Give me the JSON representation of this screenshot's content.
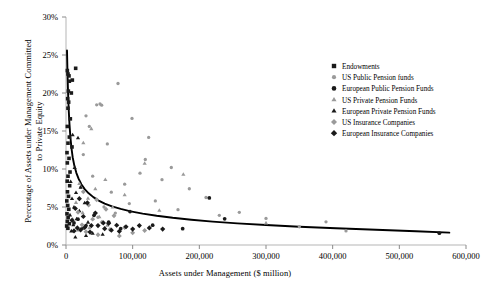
{
  "chart_data": {
    "type": "scatter",
    "title": "",
    "xlabel": "Assets under Management ($ million)",
    "ylabel": "Percentage of Assets under Management Committed to Private Equity",
    "xlim": [
      0,
      600000
    ],
    "ylim": [
      0,
      0.3
    ],
    "xticks": [
      0,
      100000,
      200000,
      300000,
      400000,
      500000,
      600000
    ],
    "xticklabels": [
      "0",
      "100,000",
      "200,000",
      "300,000",
      "400,000",
      "500,000",
      "600,000"
    ],
    "yticks": [
      0,
      0.05,
      0.1,
      0.15,
      0.2,
      0.25,
      0.3
    ],
    "yticklabels": [
      "0%",
      "5%",
      "10%",
      "15%",
      "20%",
      "25%",
      "30%"
    ],
    "grid": false,
    "legend_position": "right-top",
    "series": [
      {
        "name": "Endowments",
        "marker": "square",
        "color": "#1a1a1a",
        "size": 3.6,
        "points": [
          [
            2000,
            0.2295
          ],
          [
            3000,
            0.225
          ],
          [
            4500,
            0.2225
          ],
          [
            14500,
            0.2325
          ],
          [
            5000,
            0.2155
          ],
          [
            9500,
            0.217
          ],
          [
            3500,
            0.2025
          ],
          [
            8000,
            0.2
          ],
          [
            2500,
            0.1925
          ],
          [
            4000,
            0.188
          ],
          [
            3000,
            0.18
          ],
          [
            6500,
            0.166
          ],
          [
            2000,
            0.156
          ],
          [
            5000,
            0.142
          ],
          [
            3000,
            0.134
          ],
          [
            9000,
            0.129
          ],
          [
            1500,
            0.1215
          ],
          [
            4500,
            0.114
          ],
          [
            2000,
            0.108
          ],
          [
            6000,
            0.096
          ],
          [
            3000,
            0.0905
          ],
          [
            1800,
            0.084
          ],
          [
            5500,
            0.078
          ],
          [
            2200,
            0.07
          ],
          [
            3800,
            0.064
          ],
          [
            1200,
            0.058
          ],
          [
            2600,
            0.052
          ],
          [
            4200,
            0.047
          ],
          [
            1500,
            0.041
          ],
          [
            3200,
            0.036
          ],
          [
            2000,
            0.031
          ],
          [
            5000,
            0.028
          ],
          [
            1000,
            0.025
          ],
          [
            2800,
            0.022
          ]
        ]
      },
      {
        "name": "US Public Pension funds",
        "marker": "circle",
        "color": "#9a9a9a",
        "size": 3.0,
        "points": [
          [
            78000,
            0.2125
          ],
          [
            46000,
            0.1845
          ],
          [
            51000,
            0.1855
          ],
          [
            53500,
            0.184
          ],
          [
            99000,
            0.1665
          ],
          [
            124000,
            0.1415
          ],
          [
            30000,
            0.17
          ],
          [
            35000,
            0.156
          ],
          [
            62000,
            0.133
          ],
          [
            119000,
            0.1125
          ],
          [
            158000,
            0.102
          ],
          [
            111000,
            0.0945
          ],
          [
            144000,
            0.086
          ],
          [
            26000,
            0.119
          ],
          [
            88000,
            0.08
          ],
          [
            185000,
            0.074
          ],
          [
            40000,
            0.0905
          ],
          [
            68000,
            0.0695
          ],
          [
            210000,
            0.0625
          ],
          [
            134000,
            0.058
          ],
          [
            95000,
            0.0545
          ],
          [
            57000,
            0.05
          ],
          [
            168000,
            0.0465
          ],
          [
            260000,
            0.043
          ],
          [
            230000,
            0.039
          ],
          [
            300000,
            0.035
          ],
          [
            390000,
            0.0305
          ],
          [
            350000,
            0.024
          ],
          [
            420000,
            0.0185
          ],
          [
            22000,
            0.076
          ],
          [
            74000,
            0.042
          ],
          [
            48000,
            0.0365
          ]
        ]
      },
      {
        "name": "European Public Pension Funds",
        "marker": "circle",
        "color": "#1a1a1a",
        "size": 3.4,
        "points": [
          [
            215000,
            0.062
          ],
          [
            238000,
            0.0345
          ],
          [
            560000,
            0.0155
          ],
          [
            96000,
            0.044
          ],
          [
            42000,
            0.039
          ],
          [
            64000,
            0.03
          ],
          [
            18000,
            0.034
          ],
          [
            130000,
            0.026
          ],
          [
            175000,
            0.0215
          ],
          [
            30000,
            0.0255
          ],
          [
            82000,
            0.0215
          ],
          [
            12000,
            0.029
          ]
        ]
      },
      {
        "name": "US Private Pension Funds",
        "marker": "triangle",
        "color": "#9a9a9a",
        "size": 3.6,
        "points": [
          [
            38000,
            0.153
          ],
          [
            26000,
            0.1345
          ],
          [
            118000,
            0.1075
          ],
          [
            176000,
            0.093
          ],
          [
            59000,
            0.086
          ],
          [
            20000,
            0.081
          ],
          [
            44000,
            0.074
          ],
          [
            88000,
            0.066
          ],
          [
            33000,
            0.0615
          ],
          [
            15000,
            0.056
          ],
          [
            70000,
            0.05
          ],
          [
            140000,
            0.0455
          ],
          [
            25000,
            0.0425
          ],
          [
            50000,
            0.037
          ],
          [
            10000,
            0.034
          ],
          [
            300000,
            0.029
          ],
          [
            62000,
            0.026
          ],
          [
            35000,
            0.0225
          ],
          [
            18000,
            0.0195
          ]
        ]
      },
      {
        "name": "European Private Pension Funds",
        "marker": "triangle",
        "color": "#1a1a1a",
        "size": 3.6,
        "points": [
          [
            10000,
            0.145
          ],
          [
            18000,
            0.141
          ],
          [
            13000,
            0.102
          ],
          [
            7000,
            0.0835
          ],
          [
            22000,
            0.076
          ],
          [
            15000,
            0.069
          ],
          [
            9000,
            0.061
          ],
          [
            28000,
            0.0555
          ],
          [
            12000,
            0.05
          ],
          [
            20000,
            0.045
          ],
          [
            6000,
            0.0395
          ],
          [
            16000,
            0.0345
          ],
          [
            33000,
            0.03
          ],
          [
            11000,
            0.0265
          ],
          [
            24000,
            0.022
          ],
          [
            8000,
            0.0185
          ],
          [
            40000,
            0.0155
          ],
          [
            30000,
            0.0125
          ],
          [
            14000,
            0.0105
          ],
          [
            55000,
            0.014
          ]
        ]
      },
      {
        "name": "US Insurance Companies",
        "marker": "diamond",
        "color": "#9a9a9a",
        "size": 3.4,
        "points": [
          [
            26000,
            0.07
          ],
          [
            46000,
            0.0595
          ],
          [
            34000,
            0.0525
          ],
          [
            60000,
            0.047
          ],
          [
            18000,
            0.043
          ],
          [
            72000,
            0.0385
          ],
          [
            40000,
            0.034
          ],
          [
            54000,
            0.03
          ],
          [
            24000,
            0.0265
          ],
          [
            88000,
            0.023
          ],
          [
            66000,
            0.0205
          ],
          [
            30000,
            0.0175
          ],
          [
            100000,
            0.016
          ],
          [
            48000,
            0.0135
          ],
          [
            118000,
            0.019
          ],
          [
            80000,
            0.012
          ]
        ]
      },
      {
        "name": "European Insurance Companies",
        "marker": "diamond",
        "color": "#1a1a1a",
        "size": 3.6,
        "points": [
          [
            20000,
            0.061
          ],
          [
            32000,
            0.0555
          ],
          [
            14000,
            0.048
          ],
          [
            44000,
            0.042
          ],
          [
            26000,
            0.0375
          ],
          [
            9000,
            0.0325
          ],
          [
            56000,
            0.029
          ],
          [
            38000,
            0.0255
          ],
          [
            17000,
            0.0225
          ],
          [
            64000,
            0.0285
          ],
          [
            48000,
            0.0255
          ],
          [
            28000,
            0.023
          ],
          [
            76000,
            0.026
          ],
          [
            22000,
            0.02
          ],
          [
            90000,
            0.024
          ],
          [
            110000,
            0.0255
          ],
          [
            58000,
            0.0215
          ],
          [
            12000,
            0.0185
          ],
          [
            36000,
            0.017
          ],
          [
            68000,
            0.0195
          ],
          [
            100000,
            0.021
          ],
          [
            80000,
            0.018
          ],
          [
            125000,
            0.0225
          ],
          [
            145000,
            0.021
          ]
        ]
      }
    ],
    "trendline": {
      "name": "power-fit",
      "color": "#000000",
      "width": 1.9,
      "points": [
        [
          1500,
          0.256
        ],
        [
          2200,
          0.227
        ],
        [
          3000,
          0.202
        ],
        [
          4000,
          0.179
        ],
        [
          5200,
          0.159
        ],
        [
          6600,
          0.142
        ],
        [
          8200,
          0.1275
        ],
        [
          10000,
          0.1155
        ],
        [
          12500,
          0.1045
        ],
        [
          15500,
          0.095
        ],
        [
          19000,
          0.087
        ],
        [
          23000,
          0.08
        ],
        [
          28000,
          0.0735
        ],
        [
          34000,
          0.068
        ],
        [
          41000,
          0.063
        ],
        [
          49000,
          0.0585
        ],
        [
          58000,
          0.0545
        ],
        [
          69000,
          0.0508
        ],
        [
          82000,
          0.0475
        ],
        [
          97000,
          0.0443
        ],
        [
          115000,
          0.0413
        ],
        [
          136000,
          0.0385
        ],
        [
          160000,
          0.0358
        ],
        [
          188000,
          0.0333
        ],
        [
          220000,
          0.0308
        ],
        [
          257000,
          0.0285
        ],
        [
          300000,
          0.0263
        ],
        [
          350000,
          0.0241
        ],
        [
          405000,
          0.022
        ],
        [
          465000,
          0.02
        ],
        [
          525000,
          0.018
        ],
        [
          575000,
          0.0163
        ]
      ]
    }
  }
}
